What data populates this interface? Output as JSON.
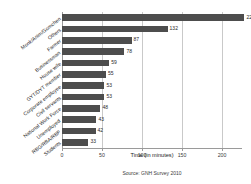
{
  "chart_data": {
    "type": "bar",
    "orientation": "horizontal",
    "title": "",
    "xlabel": "Time (in minutes)",
    "ylabel": "",
    "xlim": [
      0,
      225
    ],
    "xticks": [
      0,
      50,
      100,
      150,
      200
    ],
    "xtick_labels": [
      "0",
      "50",
      "100",
      "150",
      "200"
    ],
    "grid": true,
    "legend": "none",
    "bar_color": "#4d4d4d",
    "categories": [
      "Monk/Anim/Gomchen",
      "Others",
      "Farmer",
      "Businessman",
      "House wife",
      "GYT/DYT member",
      "Corporate employee",
      "Civil servants",
      "National Work Force",
      "Unemployed",
      "RBG/RBA/RBP",
      "Students"
    ],
    "values": [
      228,
      132,
      87,
      78,
      59,
      55,
      53,
      53,
      48,
      43,
      42,
      33
    ],
    "value_labels": [
      "228",
      "132",
      "87",
      "78",
      "59",
      "55",
      "53",
      "53",
      "48",
      "43",
      "42",
      "33"
    ],
    "annotations": {
      "source": "Source: GNH Survey 2010"
    }
  }
}
